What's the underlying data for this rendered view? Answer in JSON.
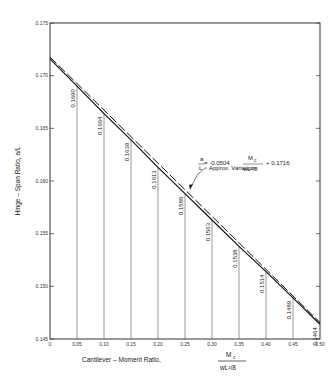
{
  "chart_data": {
    "type": "line",
    "title": "",
    "xlabel": "Cantilever - Moment Ratio, Mc / (wL²/8)",
    "xlabel_text": "Cantilever – Moment Ratio,",
    "xlabel_frac_num": "M",
    "xlabel_frac_num_sub": "c",
    "xlabel_frac_den": "wL²/8",
    "ylabel": "Hinge – Span Ratio, a/L",
    "xlim": [
      0,
      0.5
    ],
    "ylim": [
      0.145,
      0.175
    ],
    "xticks": [
      "0",
      "0.05",
      "0.10",
      "0.15",
      "0.20",
      "0.25",
      "0.30",
      "0.35",
      "0.40",
      "0.45",
      "0.50"
    ],
    "yticks": [
      "0.145",
      "0.150",
      "0.155",
      "0.160",
      "0.165",
      "0.170",
      "0.175"
    ],
    "grid": false,
    "series": [
      {
        "name": "Computed",
        "style": "solid",
        "x": [
          0,
          0.05,
          0.1,
          0.15,
          0.2,
          0.25,
          0.3,
          0.35,
          0.4,
          0.45,
          0.5
        ],
        "values": [
          0.1716,
          0.169,
          0.1664,
          0.1639,
          0.1613,
          0.1588,
          0.1563,
          0.1538,
          0.1514,
          0.1489,
          0.1464
        ]
      },
      {
        "name": "Approx. Variation",
        "style": "dashed",
        "equation": "a/L = -0.0504 Mc/(wL²/8) + 0.1716",
        "x": [
          0,
          0.5
        ],
        "values": [
          0.1716,
          0.1464
        ]
      }
    ],
    "data_labels": [
      "0.1690",
      "0.1664",
      "0.1639",
      "0.1613",
      "0.1588",
      "0.1563",
      "0.1538",
      "0.1514",
      "0.1489",
      "0.1464"
    ],
    "annotation": {
      "title": "Approx. Variation:",
      "lhs_num": "a",
      "lhs_den": "L",
      "eq": "= -0.0504",
      "frac_num": "M",
      "frac_num_sub": "c",
      "frac_den": "wL²/8",
      "tail": "+ 0.1716"
    }
  }
}
